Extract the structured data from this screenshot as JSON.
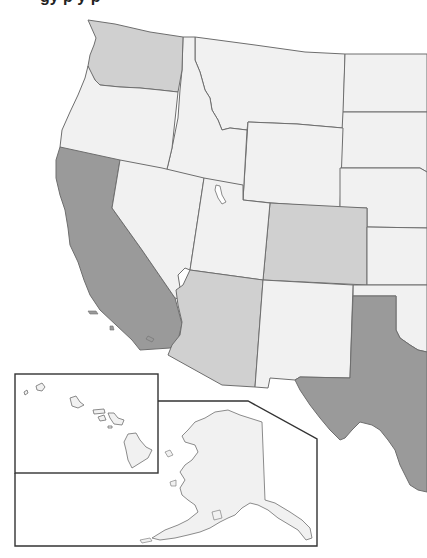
{
  "title": "gy p y p",
  "colors": {
    "dark": "#9a9a9a",
    "medium": "#d0d0d0",
    "light": "#f1f1f1",
    "border": "#6e6e6e",
    "inset_frame": "#333333"
  },
  "states": [
    {
      "name": "Washington",
      "shade": "medium"
    },
    {
      "name": "Oregon",
      "shade": "light"
    },
    {
      "name": "California",
      "shade": "dark"
    },
    {
      "name": "Idaho",
      "shade": "light"
    },
    {
      "name": "Nevada",
      "shade": "light"
    },
    {
      "name": "Montana",
      "shade": "light"
    },
    {
      "name": "Wyoming",
      "shade": "light"
    },
    {
      "name": "Utah",
      "shade": "light"
    },
    {
      "name": "Colorado",
      "shade": "medium"
    },
    {
      "name": "Arizona",
      "shade": "medium"
    },
    {
      "name": "New Mexico",
      "shade": "light"
    },
    {
      "name": "Texas",
      "shade": "dark"
    },
    {
      "name": "North Dakota",
      "shade": "light"
    },
    {
      "name": "South Dakota",
      "shade": "light"
    },
    {
      "name": "Nebraska",
      "shade": "light"
    },
    {
      "name": "Kansas",
      "shade": "light"
    },
    {
      "name": "Oklahoma",
      "shade": "light"
    },
    {
      "name": "Hawaii",
      "shade": "light"
    },
    {
      "name": "Alaska",
      "shade": "light"
    }
  ],
  "insets": [
    "Hawaii",
    "Alaska"
  ]
}
